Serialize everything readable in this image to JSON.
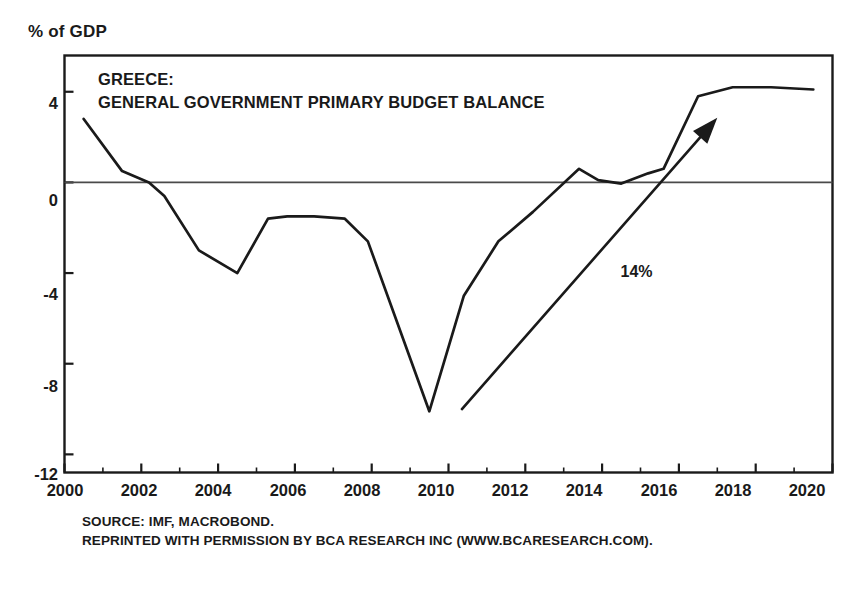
{
  "chart_data": {
    "type": "line",
    "title": "GREECE:\nGENERAL GOVERNMENT PRIMARY BUDGET BALANCE",
    "title_line1": "GREECE:",
    "title_line2": "GENERAL GOVERNMENT PRIMARY BUDGET BALANCE",
    "ylabel": "% of GDP",
    "xlabel": "",
    "xlim": [
      2000,
      2020
    ],
    "ylim": [
      -12.8,
      5.6
    ],
    "grid": false,
    "legend": "none",
    "zero_line": true,
    "xticks": [
      "2000",
      "2002",
      "2004",
      "2006",
      "2008",
      "2010",
      "2012",
      "2014",
      "2016",
      "2018",
      "2020"
    ],
    "xtick_values": [
      2000,
      2002,
      2004,
      2006,
      2008,
      2010,
      2012,
      2014,
      2016,
      2018,
      2020
    ],
    "xticks_minor": [
      2001,
      2003,
      2005,
      2007,
      2009,
      2011,
      2013,
      2015,
      2017,
      2019
    ],
    "yticks": [
      "4",
      "0",
      "-4",
      "-8",
      "-12"
    ],
    "ytick_values": [
      4,
      0,
      -4,
      -8,
      -12
    ],
    "series": [
      {
        "name": "General government primary budget balance",
        "color": "#1a1a1a",
        "x": [
          2000.5,
          2001.5,
          2002.2,
          2002.6,
          2003.5,
          2004.5,
          2005.3,
          2005.8,
          2006.5,
          2007.3,
          2007.9,
          2009.5,
          2010.4,
          2011.3,
          2012.2,
          2013.4,
          2013.9,
          2014.5,
          2015.2,
          2015.6,
          2016.5,
          2017.4,
          2018.4,
          2019.5
        ],
        "values": [
          2.8,
          0.5,
          0.0,
          -0.6,
          -3.0,
          -4.0,
          -1.6,
          -1.5,
          -1.5,
          -1.6,
          -2.6,
          -10.1,
          -5.0,
          -2.6,
          -1.3,
          0.6,
          0.1,
          -0.05,
          0.4,
          0.6,
          3.8,
          4.2,
          4.2,
          4.1
        ]
      }
    ],
    "annotations": [
      {
        "type": "arrow",
        "label": "14%",
        "x_start": 2010.35,
        "y_start": -10.0,
        "x_end": 2017.0,
        "y_end": 2.85,
        "label_x": 2015.0,
        "label_y": -4.0
      }
    ],
    "source_line1": "SOURCE: IMF, MACROBOND.",
    "source_line2": "REPRINTED WITH PERMISSION BY BCA RESEARCH INC (WWW.BCARESEARCH.COM)."
  },
  "colors": {
    "line": "#1a1a1a",
    "frame": "#1a1a1a",
    "zero_line": "#4a4a4a",
    "text": "#1a1a1a",
    "background": "#ffffff"
  }
}
